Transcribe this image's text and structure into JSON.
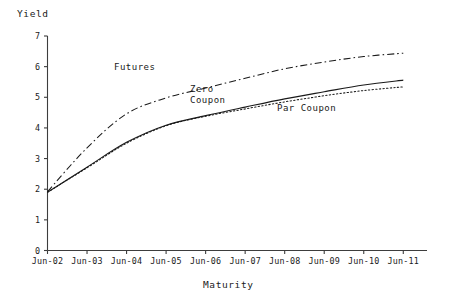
{
  "chart_data": {
    "type": "line",
    "title": "",
    "xlabel": "Maturity",
    "ylabel": "Yield",
    "grid": false,
    "legend_position": "inline-annotations",
    "xlim": [
      0,
      9.6
    ],
    "ylim": [
      0,
      7
    ],
    "yticks": [
      0,
      1,
      2,
      3,
      4,
      5,
      6,
      7
    ],
    "ytick_labels": [
      "0",
      "1",
      "2",
      "3",
      "4",
      "5",
      "6",
      "7"
    ],
    "categories": [
      "Jun-02",
      "Jun-03",
      "Jun-04",
      "Jun-05",
      "Jun-06",
      "Jun-07",
      "Jun-08",
      "Jun-09",
      "Jun-10",
      "Jun-11"
    ],
    "x": [
      0,
      1,
      2,
      3,
      4,
      5,
      6,
      7,
      8,
      9
    ],
    "series": [
      {
        "name": "Futures",
        "style": "dash-dot",
        "label": "Futures",
        "values": [
          1.92,
          3.35,
          4.46,
          4.98,
          5.3,
          5.62,
          5.93,
          6.15,
          6.33,
          6.44
        ]
      },
      {
        "name": "Zero Coupon",
        "style": "solid",
        "label": "Zero\nCoupon",
        "label_line1": "Zero",
        "label_line2": "Coupon",
        "values": [
          1.9,
          2.72,
          3.53,
          4.09,
          4.4,
          4.68,
          4.95,
          5.18,
          5.4,
          5.56
        ]
      },
      {
        "name": "Par Coupon",
        "style": "dotted",
        "label": "Par Coupon",
        "values": [
          1.9,
          2.7,
          3.5,
          4.07,
          4.38,
          4.62,
          4.85,
          5.05,
          5.22,
          5.34
        ]
      }
    ]
  },
  "axes": {
    "y_title": "Yield",
    "x_title": "Maturity"
  },
  "annotations": {
    "futures": "Futures",
    "zero_line1": "Zero",
    "zero_line2": "Coupon",
    "par": "Par Coupon"
  },
  "colors": {
    "axis": "#3d3d3d",
    "series_line": "#1a1a1a",
    "background": "#ffffff"
  }
}
